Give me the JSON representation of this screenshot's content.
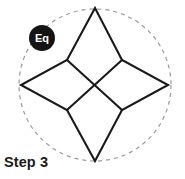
{
  "figure": {
    "caption": "Step 3",
    "badge": {
      "label": "Eq",
      "fill_color": "#141414",
      "text_color": "#ffffff",
      "center_x": 42,
      "center_y": 38,
      "radius": 13
    },
    "boundary_circle": {
      "center_x": 95,
      "center_y": 85,
      "radius": 76,
      "stroke_color": "#9a9a9a",
      "stroke_style": "dashed",
      "stroke_width": 1.2,
      "dash_pattern": "4 4"
    },
    "star": {
      "description": "four-pointed concave star",
      "stroke_color": "#1a1a1a",
      "stroke_width": 2.1,
      "fill": "none",
      "outer_points": [
        {
          "name": "top",
          "x": 95,
          "y": 8
        },
        {
          "name": "right",
          "x": 168,
          "y": 85
        },
        {
          "name": "bottom",
          "x": 95,
          "y": 161
        },
        {
          "name": "left",
          "x": 21,
          "y": 85
        }
      ],
      "inner_points": [
        {
          "name": "top-left",
          "x": 67,
          "y": 60
        },
        {
          "name": "top-right",
          "x": 122,
          "y": 60
        },
        {
          "name": "bottom-right",
          "x": 122,
          "y": 110
        },
        {
          "name": "bottom-left",
          "x": 67,
          "y": 110
        }
      ],
      "outline_path": "M 95 8 L 122 60 L 168 85 L 122 110 L 95 161 L 67 110 L 21 85 L 67 60 Z"
    },
    "center_cross": {
      "description": "diagonal lines connecting opposite inner vertices through the center",
      "stroke_color": "#1a1a1a",
      "stroke_width": 2.1,
      "segments": [
        {
          "x1": 67,
          "y1": 60,
          "x2": 122,
          "y2": 110
        },
        {
          "x1": 122,
          "y1": 60,
          "x2": 67,
          "y2": 110
        }
      ]
    }
  }
}
